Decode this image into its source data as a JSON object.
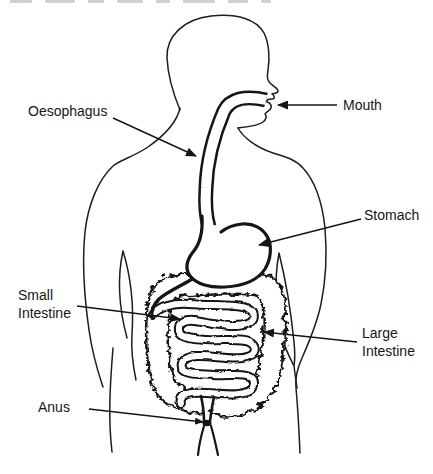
{
  "figure": {
    "background_color": "#ffffff",
    "ink_color": "#1a1a1a",
    "labels": {
      "oesophagus": {
        "lines": [
          "Oesophagus"
        ]
      },
      "mouth": {
        "lines": [
          "Mouth"
        ]
      },
      "stomach": {
        "lines": [
          "Stomach"
        ]
      },
      "small_intestine": {
        "lines": [
          "Small",
          "Intestine"
        ]
      },
      "large_intestine": {
        "lines": [
          "Large",
          "Intestine"
        ]
      },
      "anus": {
        "lines": [
          "Anus"
        ]
      }
    },
    "decorations": {
      "top_edge_print_fragments": true
    }
  }
}
